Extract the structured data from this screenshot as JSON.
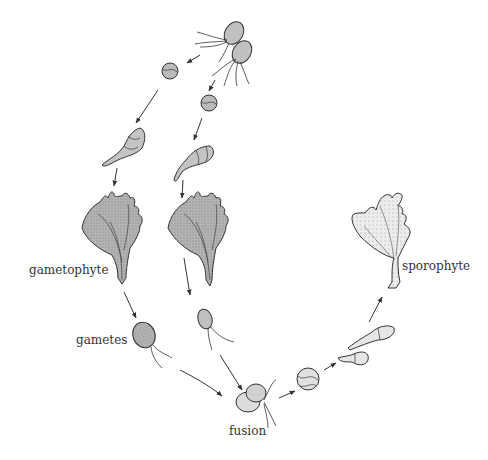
{
  "diagram": {
    "type": "life-cycle",
    "labels": {
      "gametophyte": "gametophyte",
      "gametes": "gametes",
      "fusion": "fusion",
      "sporophyte": "sporophyte"
    },
    "colors": {
      "stroke": "#333333",
      "fill_dark": "#a9a9a9",
      "fill_mid": "#c8c8c8",
      "fill_light": "#e6e6e6",
      "background": "#ffffff"
    }
  }
}
